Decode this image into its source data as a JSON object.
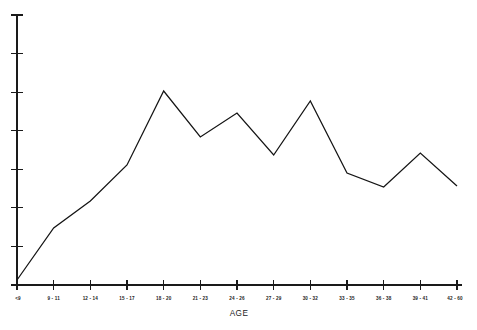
{
  "chart_data": {
    "type": "line",
    "title": "",
    "subtitle": "",
    "xlabel": "AGE",
    "ylabel": "",
    "grid": false,
    "legend": false,
    "legend_position": "none",
    "categories": [
      "<9",
      "9 - 11",
      "12 - 14",
      "15 - 17",
      "18 - 20",
      "21 - 23",
      "24 - 26",
      "27 - 29",
      "30 - 32",
      "33 - 35",
      "36 - 38",
      "39 - 41",
      "42 - 60"
    ],
    "values": [
      5,
      57,
      84,
      120,
      194,
      148,
      172,
      130,
      184,
      112,
      98,
      132,
      99
    ],
    "ylim": [
      0,
      270
    ],
    "xlim_labels": [
      "<9",
      "42 - 60"
    ],
    "y_tick_count": 8,
    "y_tick_values": [
      0,
      38.6,
      77.1,
      115.7,
      154.3,
      192.9,
      231.4,
      270
    ],
    "y_axis_labeled": false,
    "series": [
      {
        "name": "frequency",
        "color": "#141414",
        "values": [
          5,
          57,
          84,
          120,
          194,
          148,
          172,
          130,
          184,
          112,
          98,
          132,
          99
        ]
      }
    ]
  },
  "axis": {
    "x_title": "AGE",
    "tick_labels": [
      "<9",
      "9 - 11",
      "12 - 14",
      "15 - 17",
      "18 - 20",
      "21 - 23",
      "24 - 26",
      "27 - 29",
      "30 - 32",
      "33 - 35",
      "36 - 38",
      "39 - 41",
      "42 - 60"
    ]
  },
  "colors": {
    "line": "#141414",
    "axis": "#1a1a1a",
    "text": "#1c1c1c",
    "background": "#ffffff"
  }
}
